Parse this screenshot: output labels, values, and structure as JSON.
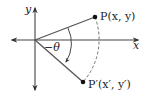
{
  "diagram": {
    "type": "rotation-of-point",
    "colors": {
      "line": "#444444",
      "text": "#222222",
      "point": "#111111",
      "background": "#ffffff"
    },
    "axes": {
      "x_label": "x",
      "y_label": "y"
    },
    "points": [
      {
        "id": "P",
        "label": "P(x, y)"
      },
      {
        "id": "P_prime",
        "label": "P′(x′, y′)"
      }
    ],
    "angle": {
      "label": "−θ",
      "direction": "clockwise"
    },
    "arc": {
      "style": "dashed",
      "from": "P",
      "to": "P_prime"
    }
  }
}
